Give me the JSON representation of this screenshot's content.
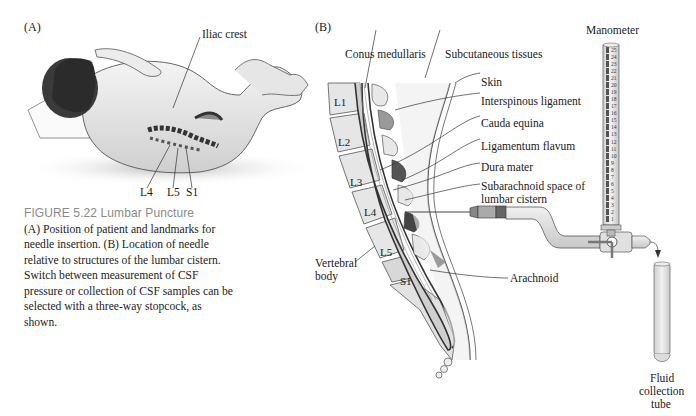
{
  "panel_a": {
    "label": "(A)",
    "labels": {
      "iliac_crest": "Iliac crest",
      "l4": "L4",
      "l5": "L5",
      "s1": "S1"
    }
  },
  "caption": {
    "title": "FIGURE 5.22  Lumbar Puncture",
    "body": "(A) Position of patient and landmarks for needle insertion. (B) Location of needle relative to structures of the lumbar cistern. Switch between measurement of CSF pressure or collection of CSF samples can be selected with a three-way stopcock, as shown."
  },
  "panel_b": {
    "label": "(B)",
    "labels": {
      "conus_medullaris": "Conus medullaris",
      "subcutaneous_tissues": "Subcutaneous tissues",
      "skin": "Skin",
      "interspinous_ligament": "Interspinous ligament",
      "cauda_equina": "Cauda equina",
      "ligamentum_flavum": "Ligamentum flavum",
      "dura_mater": "Dura mater",
      "subarachnoid_line1": "Subarachnoid space of",
      "subarachnoid_line2": "lumbar cistern",
      "arachnoid": "Arachnoid",
      "vertebral_line1": "Vertebral",
      "vertebral_line2": "body",
      "manometer": "Manometer",
      "tube_line1": "Fluid",
      "tube_line2": "collection",
      "tube_line3": "tube"
    },
    "vertebrae": [
      "L1",
      "L2",
      "L3",
      "L4",
      "L5",
      "S1"
    ],
    "manometer_scale": [
      "25",
      "24",
      "23",
      "22",
      "21",
      "20",
      "19",
      "18",
      "17",
      "16",
      "15",
      "14",
      "13",
      "12",
      "11",
      "10",
      "9",
      "8",
      "7",
      "6",
      "5",
      "4",
      "3",
      "2",
      "1"
    ]
  },
  "colors": {
    "caption_title": "#8a8a8a",
    "bone": "#e4e4e4",
    "tissue": "#d9d9d9",
    "ligament_dark": "#555555"
  }
}
